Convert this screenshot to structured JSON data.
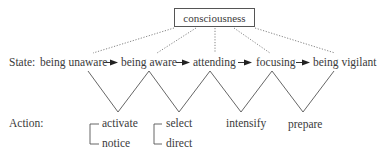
{
  "root": {
    "label": "consciousness"
  },
  "state": {
    "row_label": "State:",
    "items": [
      "being unaware",
      "being aware",
      "attending",
      "focusing",
      "being vigilant"
    ]
  },
  "action": {
    "row_label": "Action:",
    "groups": [
      {
        "items": [
          "activate",
          "notice"
        ],
        "bracketed": true
      },
      {
        "items": [
          "select",
          "direct"
        ],
        "bracketed": true
      },
      {
        "items": [
          "intensify"
        ],
        "bracketed": false
      },
      {
        "items": [
          "prepare"
        ],
        "bracketed": false
      }
    ]
  },
  "colors": {
    "text": "#3a3a3a",
    "line": "#555555"
  }
}
